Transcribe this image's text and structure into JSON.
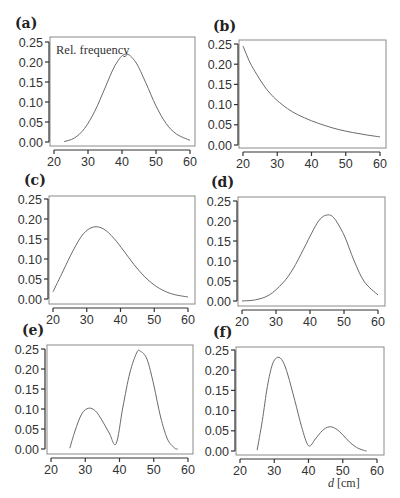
{
  "figure": {
    "xlabel_var": "d",
    "xlabel_unit": " [cm]",
    "panels": [
      {
        "id": "a",
        "label": "(a)",
        "annotation": "Rel. frequency"
      },
      {
        "id": "b",
        "label": "(b)",
        "annotation": ""
      },
      {
        "id": "c",
        "label": "(c)",
        "annotation": ""
      },
      {
        "id": "d",
        "label": "(d)",
        "annotation": ""
      },
      {
        "id": "e",
        "label": "(e)",
        "annotation": ""
      },
      {
        "id": "f",
        "label": "(f)",
        "annotation": ""
      }
    ],
    "colors": {
      "curve": "#6a6a6a",
      "axis": "#333333",
      "frame": "#8a8a8a"
    }
  },
  "chart_data": [
    {
      "panel": "(a)",
      "type": "line",
      "title": "",
      "annotation": "Rel. frequency",
      "xlabel": "",
      "ylabel": "Rel. frequency",
      "xlim": [
        20,
        60
      ],
      "ylim": [
        0,
        0.25
      ],
      "xticks": [
        20,
        30,
        40,
        50,
        60
      ],
      "yticks": [
        "0.00",
        "0.05",
        "0.10",
        "0.15",
        "0.20",
        "0.25"
      ],
      "description": "Symmetric unimodal bell curve peaking at d≈41 with 0.22",
      "x": [
        23,
        26,
        29,
        32,
        35,
        38,
        41,
        44,
        47,
        50,
        53,
        56,
        60
      ],
      "y": [
        0.001,
        0.01,
        0.034,
        0.077,
        0.135,
        0.192,
        0.22,
        0.2,
        0.148,
        0.09,
        0.046,
        0.02,
        0.004
      ]
    },
    {
      "panel": "(b)",
      "type": "line",
      "title": "",
      "xlabel": "",
      "ylabel": "",
      "xlim": [
        20,
        60
      ],
      "ylim": [
        0,
        0.25
      ],
      "xticks": [
        20,
        30,
        40,
        50,
        60
      ],
      "yticks": [
        "0.00",
        "0.05",
        "0.10",
        "0.15",
        "0.20",
        "0.25"
      ],
      "description": "Monotonically decreasing curve from 0.245 at d=20 to 0.02 at d=60",
      "x": [
        20,
        22,
        24,
        26,
        28,
        30,
        33,
        36,
        40,
        44,
        48,
        52,
        56,
        60
      ],
      "y": [
        0.245,
        0.205,
        0.175,
        0.148,
        0.127,
        0.11,
        0.09,
        0.075,
        0.06,
        0.048,
        0.038,
        0.031,
        0.025,
        0.02
      ]
    },
    {
      "panel": "(c)",
      "type": "line",
      "title": "",
      "xlabel": "",
      "ylabel": "",
      "xlim": [
        20,
        60
      ],
      "ylim": [
        0,
        0.25
      ],
      "xticks": [
        20,
        30,
        40,
        50,
        60
      ],
      "yticks": [
        "0.00",
        "0.05",
        "0.10",
        "0.15",
        "0.20",
        "0.25"
      ],
      "description": "Right-skewed unimodal curve peaking at d≈32 with 0.18",
      "x": [
        20,
        23,
        26,
        29,
        32,
        35,
        38,
        41,
        44,
        47,
        50,
        53,
        56,
        60
      ],
      "y": [
        0.018,
        0.07,
        0.122,
        0.163,
        0.18,
        0.175,
        0.152,
        0.12,
        0.086,
        0.057,
        0.035,
        0.02,
        0.011,
        0.005
      ]
    },
    {
      "panel": "(d)",
      "type": "line",
      "title": "",
      "xlabel": "",
      "ylabel": "",
      "xlim": [
        20,
        60
      ],
      "ylim": [
        0,
        0.25
      ],
      "xticks": [
        20,
        30,
        40,
        50,
        60
      ],
      "yticks": [
        "0.00",
        "0.05",
        "0.10",
        "0.15",
        "0.20",
        "0.25"
      ],
      "description": "Left-skewed unimodal curve peaking at d≈45 with 0.215",
      "x": [
        20,
        24,
        28,
        32,
        35,
        38,
        41,
        43,
        45,
        47,
        50,
        53,
        56,
        60
      ],
      "y": [
        0.0,
        0.003,
        0.015,
        0.045,
        0.08,
        0.128,
        0.178,
        0.205,
        0.215,
        0.208,
        0.165,
        0.1,
        0.048,
        0.015
      ]
    },
    {
      "panel": "(e)",
      "type": "line",
      "title": "",
      "xlabel": "",
      "ylabel": "",
      "xlim": [
        20,
        60
      ],
      "ylim": [
        0,
        0.25
      ],
      "xticks": [
        20,
        30,
        40,
        50,
        60
      ],
      "yticks": [
        "0.00",
        "0.05",
        "0.10",
        "0.15",
        "0.20",
        "0.25"
      ],
      "description": "Bimodal: small peak ≈0.10 at d≈31, minimum ≈0.013 at d≈39, large peak ≈0.245 at d≈46",
      "x": [
        25.5,
        27,
        29,
        31,
        33,
        35,
        37,
        39,
        41,
        43,
        45,
        46,
        48,
        50,
        52,
        54,
        56,
        57
      ],
      "y": [
        0.002,
        0.045,
        0.088,
        0.102,
        0.095,
        0.07,
        0.04,
        0.013,
        0.105,
        0.19,
        0.24,
        0.245,
        0.225,
        0.16,
        0.08,
        0.025,
        0.003,
        0.0
      ]
    },
    {
      "panel": "(f)",
      "type": "line",
      "title": "",
      "xlabel": "d [cm]",
      "ylabel": "",
      "xlim": [
        20,
        60
      ],
      "ylim": [
        0,
        0.25
      ],
      "xticks": [
        20,
        30,
        40,
        50,
        60
      ],
      "yticks": [
        "0.00",
        "0.05",
        "0.10",
        "0.15",
        "0.20",
        "0.25"
      ],
      "description": "Bimodal: large peak ≈0.232 at d≈31, minimum ≈0.013 at d≈40, small peak ≈0.06 at d≈46",
      "x": [
        25,
        26.5,
        28,
        29.5,
        31,
        32.5,
        34,
        36,
        38,
        40,
        42,
        44,
        46,
        48,
        50,
        52,
        54,
        56,
        57
      ],
      "y": [
        0.002,
        0.075,
        0.16,
        0.215,
        0.232,
        0.222,
        0.188,
        0.125,
        0.06,
        0.013,
        0.03,
        0.05,
        0.06,
        0.055,
        0.04,
        0.022,
        0.009,
        0.002,
        0.0
      ]
    }
  ]
}
